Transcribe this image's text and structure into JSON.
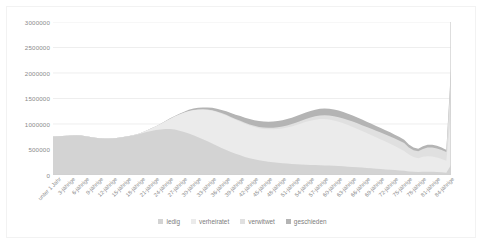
{
  "chart_data": {
    "type": "area",
    "stacked": true,
    "title": "",
    "subtitle": "",
    "xlabel": "",
    "ylabel": "",
    "ylim": [
      0,
      3000000
    ],
    "ytick_values": [
      0,
      500000,
      1000000,
      1500000,
      2000000,
      2500000,
      3000000
    ],
    "ytick_labels": [
      "0",
      "500000",
      "1000000",
      "1500000",
      "2000000",
      "2500000",
      "3000000"
    ],
    "grid": true,
    "legend_position": "bottom",
    "legend": [
      "ledig",
      "verheiratet",
      "verwitwet",
      "geschieden"
    ],
    "colors": {
      "ledig": "#d3d3d3",
      "verheiratet": "#ebebeb",
      "verwitwet": "#e0e0e0",
      "geschieden": "#b4b4b4",
      "gridline": "#e6e6e6",
      "axis_text": "#8a8a8a",
      "plot_border": "#d0d0d0"
    },
    "categories": [
      "unter 1 Jahr",
      "1-jährige",
      "2-jährige",
      "3-jährige",
      "4-jährige",
      "5-jährige",
      "6-jährige",
      "7-jährige",
      "8-jährige",
      "9-jährige",
      "10-jährige",
      "11-jährige",
      "12-jährige",
      "13-jährige",
      "14-jährige",
      "15-jährige",
      "16-jährige",
      "17-jährige",
      "18-jährige",
      "19-jährige",
      "20-jährige",
      "21-jährige",
      "22-jährige",
      "23-jährige",
      "24-jährige",
      "25-jährige",
      "26-jährige",
      "27-jährige",
      "28-jährige",
      "29-jährige",
      "30-jährige",
      "31-jährige",
      "32-jährige",
      "33-jährige",
      "34-jährige",
      "35-jährige",
      "36-jährige",
      "37-jährige",
      "38-jährige",
      "39-jährige",
      "40-jährige",
      "41-jährige",
      "42-jährige",
      "43-jährige",
      "44-jährige",
      "45-jährige",
      "46-jährige",
      "47-jährige",
      "48-jährige",
      "49-jährige",
      "50-jährige",
      "51-jährige",
      "52-jährige",
      "53-jährige",
      "54-jährige",
      "55-jährige",
      "56-jährige",
      "57-jährige",
      "58-jährige",
      "59-jährige",
      "60-jährige",
      "61-jährige",
      "62-jährige",
      "63-jährige",
      "64-jährige",
      "65-jährige",
      "66-jährige",
      "67-jährige",
      "68-jährige",
      "69-jährige",
      "70-jährige",
      "71-jährige",
      "72-jährige",
      "73-jährige",
      "74-jährige",
      "75-jährige",
      "76-jährige",
      "77-jährige",
      "78-jährige",
      "79-jährige",
      "80-jährige",
      "81-jährige",
      "82-jährige",
      "83-jährige",
      "84-jährige",
      "85-jährige und älter"
    ],
    "xtick_labels_shown": [
      "unter 1 Jahr",
      "3-jährige",
      "6-jährige",
      "9-jährige",
      "12-jährige",
      "15-jährige",
      "18-jährige",
      "21-jährige",
      "24-jährige",
      "27-jährige",
      "30-jährige",
      "33-jährige",
      "36-jährige",
      "39-jährige",
      "42-jährige",
      "45-jährige",
      "48-jährige",
      "51-jährige",
      "54-jährige",
      "57-jährige",
      "60-jährige",
      "63-jährige",
      "66-jährige",
      "69-jährige",
      "72-jährige",
      "75-jährige",
      "78-jährige",
      "81-jährige",
      "84-jährige"
    ],
    "series": [
      {
        "name": "ledig",
        "values": [
          755000,
          760000,
          765000,
          770000,
          775000,
          780000,
          775000,
          760000,
          745000,
          730000,
          720000,
          715000,
          715000,
          720000,
          730000,
          745000,
          760000,
          775000,
          795000,
          820000,
          845000,
          865000,
          880000,
          890000,
          900000,
          900000,
          890000,
          870000,
          845000,
          815000,
          780000,
          740000,
          700000,
          660000,
          620000,
          575000,
          530000,
          490000,
          450000,
          415000,
          385000,
          355000,
          330000,
          310000,
          290000,
          275000,
          262000,
          250000,
          240000,
          232000,
          225000,
          218000,
          212000,
          207000,
          202000,
          198000,
          195000,
          192000,
          188000,
          184000,
          180000,
          175000,
          170000,
          164000,
          158000,
          152000,
          145000,
          138000,
          131000,
          124000,
          117000,
          110000,
          103000,
          96000,
          89000,
          82000,
          70000,
          62000,
          58000,
          62000,
          64000,
          62000,
          58000,
          52000,
          46000,
          195000
        ]
      },
      {
        "name": "verheiratet",
        "values": [
          0,
          0,
          0,
          0,
          0,
          0,
          0,
          0,
          0,
          0,
          0,
          0,
          0,
          0,
          0,
          0,
          500,
          2000,
          6000,
          14000,
          28000,
          48000,
          75000,
          110000,
          150000,
          200000,
          255000,
          315000,
          375000,
          435000,
          490000,
          540000,
          580000,
          615000,
          640000,
          660000,
          672000,
          676000,
          674000,
          668000,
          660000,
          650000,
          640000,
          632000,
          628000,
          628000,
          634000,
          645000,
          660000,
          680000,
          705000,
          735000,
          770000,
          805000,
          840000,
          868000,
          890000,
          905000,
          910000,
          905000,
          890000,
          870000,
          845000,
          815000,
          785000,
          752000,
          718000,
          684000,
          650000,
          615000,
          580000,
          545000,
          510000,
          472000,
          432000,
          390000,
          330000,
          290000,
          270000,
          295000,
          305000,
          300000,
          285000,
          262000,
          235000,
          995000
        ]
      },
      {
        "name": "verwitwet",
        "values": [
          0,
          0,
          0,
          0,
          0,
          0,
          0,
          0,
          0,
          0,
          0,
          0,
          0,
          0,
          0,
          0,
          0,
          0,
          0,
          100,
          200,
          400,
          700,
          1000,
          1500,
          2000,
          2600,
          3300,
          4000,
          4800,
          5600,
          6500,
          7400,
          8400,
          9500,
          10600,
          11800,
          13100,
          14500,
          16000,
          17600,
          19300,
          21100,
          23000,
          25000,
          27200,
          29600,
          32200,
          35000,
          38000,
          41200,
          44600,
          48200,
          52000,
          56000,
          60200,
          64600,
          69200,
          74000,
          79000,
          84000,
          89000,
          94000,
          99000,
          104000,
          109000,
          114000,
          119000,
          124000,
          129000,
          134000,
          139000,
          144000,
          148000,
          152000,
          155000,
          140000,
          135000,
          138000,
          155000,
          168000,
          176000,
          178000,
          175000,
          168000,
          780000
        ]
      },
      {
        "name": "geschieden",
        "values": [
          0,
          0,
          0,
          0,
          0,
          0,
          0,
          0,
          0,
          0,
          0,
          0,
          0,
          0,
          0,
          0,
          0,
          0,
          0,
          200,
          600,
          1400,
          2600,
          4200,
          6200,
          8600,
          11400,
          14600,
          18200,
          22200,
          26600,
          31400,
          36600,
          42200,
          48200,
          54600,
          61400,
          68600,
          76200,
          84200,
          92000,
          99000,
          105000,
          110000,
          114000,
          117000,
          119500,
          121500,
          123000,
          124000,
          125000,
          126000,
          127000,
          128000,
          129000,
          130000,
          131000,
          132000,
          132500,
          132000,
          131000,
          129000,
          126500,
          123000,
          119000,
          114500,
          110000,
          105000,
          100000,
          95000,
          90000,
          85000,
          80000,
          75000,
          70000,
          65000,
          56000,
          50000,
          48000,
          52000,
          55000,
          55000,
          52000,
          48000,
          43000,
          130000
        ]
      }
    ]
  }
}
